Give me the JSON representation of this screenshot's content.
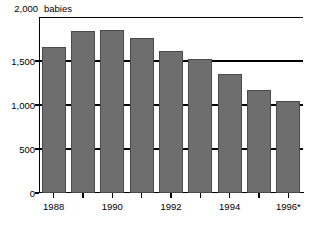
{
  "chart_data": {
    "type": "bar",
    "title": "",
    "unit_label": "babies",
    "xlabel": "",
    "ylabel": "",
    "categories": [
      "1988",
      "1989",
      "1990",
      "1991",
      "1992",
      "1993",
      "1994",
      "1995",
      "1996*"
    ],
    "values": [
      1660,
      1840,
      1855,
      1760,
      1610,
      1525,
      1355,
      1175,
      1045
    ],
    "ylim": [
      0,
      2000
    ],
    "ytick_values": [
      0,
      500,
      1000,
      1500,
      2000
    ],
    "ytick_labels": [
      "0",
      "500",
      "1,000",
      "1,500",
      "2,000"
    ],
    "xtick_labels_shown": [
      "1988",
      "1990",
      "1992",
      "1994",
      "1996*"
    ],
    "grid": true,
    "legend": "none",
    "bar_color": "#6e6e6e",
    "bar_border_color": "#4a4a4a",
    "axis_color": "#000000",
    "background": "#ffffff",
    "footnote_marker": "*"
  }
}
